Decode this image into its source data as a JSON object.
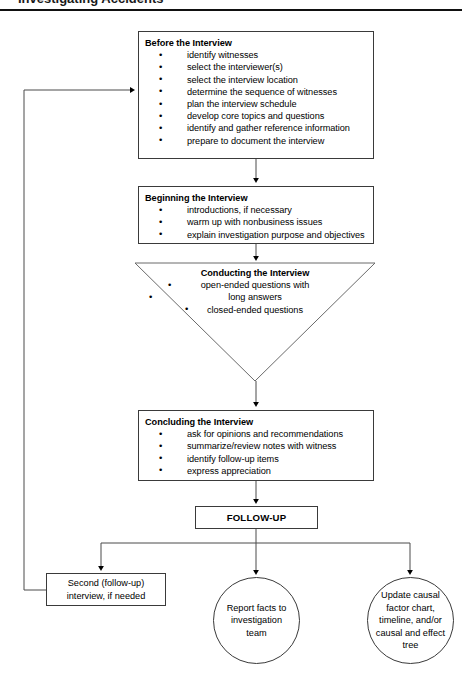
{
  "page": {
    "top_partial_text": "Investigating Accidents",
    "background_color": "#ffffff",
    "line_color": "#3a3a3a"
  },
  "flowchart": {
    "title": "Interview Process Flowchart",
    "nodes": [
      {
        "id": "before",
        "shape": "rectangle",
        "title": "Before the Interview",
        "bullets": [
          "identify witnesses",
          "select the interviewer(s)",
          "select the interview location",
          "determine the sequence of witnesses",
          "plan the interview schedule",
          "develop core topics and questions",
          "identify and gather reference information",
          "prepare to document the interview"
        ]
      },
      {
        "id": "beginning",
        "shape": "rectangle",
        "title": "Beginning the Interview",
        "bullets": [
          "introductions, if necessary",
          "warm up with nonbusiness issues",
          "explain investigation purpose and objectives"
        ]
      },
      {
        "id": "conducting",
        "shape": "inverted-triangle",
        "title": "Conducting the Interview",
        "bullets": [
          "open-ended questions with",
          "long answers",
          "closed-ended questions"
        ]
      },
      {
        "id": "concluding",
        "shape": "rectangle",
        "title": "Concluding the Interview",
        "bullets": [
          "ask for opinions and recommendations",
          "summarize/review notes with witness",
          "identify follow-up items",
          "express appreciation"
        ]
      },
      {
        "id": "followup",
        "shape": "rectangle",
        "title": "FOLLOW-UP",
        "bullets": []
      },
      {
        "id": "second-interview",
        "shape": "rectangle",
        "label_line1": "Second (follow-up)",
        "label_line2": "interview, if needed"
      },
      {
        "id": "report-facts",
        "shape": "circle",
        "label_line1": "Report facts to",
        "label_line2": "investigation",
        "label_line3": "team"
      },
      {
        "id": "update-causal",
        "shape": "circle",
        "label_line1": "Update causal",
        "label_line2": "factor chart,",
        "label_line3": "timeline, and/or",
        "label_line4": "causal and effect",
        "label_line5": "tree"
      }
    ],
    "connectors": [
      {
        "from": "before",
        "to": "beginning",
        "type": "arrow-down"
      },
      {
        "from": "beginning",
        "to": "conducting",
        "type": "arrow-down"
      },
      {
        "from": "conducting",
        "to": "concluding",
        "type": "arrow-down"
      },
      {
        "from": "concluding",
        "to": "followup",
        "type": "arrow-down"
      },
      {
        "from": "followup",
        "to": "second-interview",
        "type": "branch-arrow"
      },
      {
        "from": "followup",
        "to": "report-facts",
        "type": "branch-arrow"
      },
      {
        "from": "followup",
        "to": "update-causal",
        "type": "branch-arrow"
      },
      {
        "from": "second-interview",
        "to": "before",
        "type": "feedback-loop-left"
      }
    ]
  }
}
